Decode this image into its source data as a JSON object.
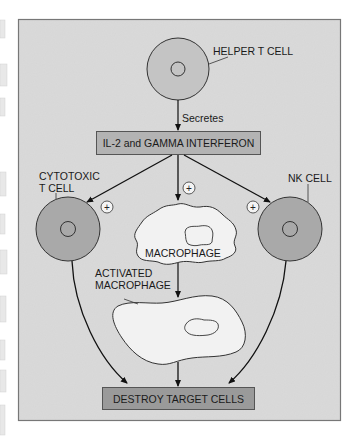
{
  "diagram": {
    "title": "",
    "colors": {
      "background": "#d9d9d9",
      "frame_border": "#777777",
      "cell_fill": "#a9a9a9",
      "cell_stroke": "#333333",
      "box_fill_il2": "#b3b3b3",
      "box_fill_destroy": "#9a9a9a",
      "macrophage_fill": "#f2f2f2",
      "arrow": "#111111"
    },
    "nodes": {
      "helper_t_cell": {
        "label": "HELPER T CELL"
      },
      "secretes": {
        "label": "Secretes"
      },
      "cytokines": {
        "label": "IL-2 and GAMMA INTERFERON"
      },
      "cytotoxic_t_cell": {
        "label_line1": "CYTOTOXIC",
        "label_line2": "T CELL"
      },
      "nk_cell": {
        "label": "NK CELL"
      },
      "macrophage": {
        "label": "MACROPHAGE"
      },
      "activated_macrophage": {
        "label_line1": "ACTIVATED",
        "label_line2": "MACROPHAGE"
      },
      "destroy": {
        "label": "DESTROY TARGET CELLS"
      }
    },
    "stimulation_symbol": "+",
    "edges": [
      {
        "from": "helper_t_cell",
        "to": "cytokines",
        "label": "Secretes"
      },
      {
        "from": "cytokines",
        "to": "cytotoxic_t_cell",
        "sign": "+"
      },
      {
        "from": "cytokines",
        "to": "macrophage",
        "sign": "+"
      },
      {
        "from": "cytokines",
        "to": "nk_cell",
        "sign": "+"
      },
      {
        "from": "macrophage",
        "to": "activated_macrophage"
      },
      {
        "from": "cytotoxic_t_cell",
        "to": "destroy"
      },
      {
        "from": "activated_macrophage",
        "to": "destroy"
      },
      {
        "from": "nk_cell",
        "to": "destroy"
      }
    ]
  }
}
